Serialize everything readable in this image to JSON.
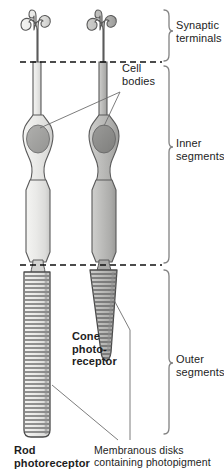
{
  "figure": {
    "type": "anatomical-diagram"
  },
  "brackets": {
    "synaptic_terminals": "Synaptic\nterminals",
    "inner_segments": "Inner\nsegments",
    "outer_segments": "Outer\nsegments"
  },
  "callouts": {
    "cell_bodies": "Cell\nbodies",
    "membranous_disks": "Membranous disks\ncontaining photopigment"
  },
  "cells": {
    "rod": {
      "name": "Rod\nphotoreceptor",
      "fill": "#e8e8e6",
      "nucleus_fill": "#9c9c9c",
      "outline": "#4a4a4a"
    },
    "cone": {
      "name": "Cone\nphoto-\nreceptor",
      "fill": "#b9b9b7",
      "nucleus_fill": "#8a8a8a",
      "outline": "#4a4a4a"
    }
  },
  "colors": {
    "background": "#ffffff",
    "text": "#1d1d1d",
    "divider": "#111111",
    "bracket": "#7a7a7a",
    "leader": "#6e6e6e",
    "disk_line": "#6f6f6f"
  },
  "dividers": [
    {
      "name": "synaptic-inner-divider",
      "y": 62
    },
    {
      "name": "inner-outer-divider",
      "y": 265
    }
  ]
}
